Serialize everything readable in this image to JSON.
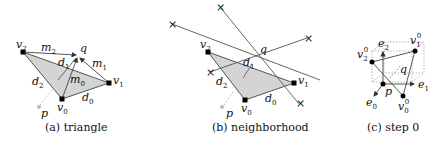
{
  "figure": {
    "panels": [
      {
        "id": "a",
        "caption": "(a) triangle",
        "labels": {
          "v2": "v",
          "v2_sub": "2",
          "m2": "m",
          "m2_sub": "2",
          "q": "q",
          "d1": "d",
          "d1_sub": "1",
          "m1": "m",
          "m1_sub": "1",
          "v1": "v",
          "v1_sub": "1",
          "d2": "d",
          "d2_sub": "2",
          "m0": "m",
          "m0_sub": "0",
          "p": "p",
          "v0": "v",
          "v0_sub": "0",
          "d0": "d",
          "d0_sub": "0"
        }
      },
      {
        "id": "b",
        "caption": "(b) neighborhood",
        "labels": {
          "v2": "v",
          "v2_sub": "2",
          "q": "q",
          "d1": "d",
          "d1_sub": "1",
          "v1": "v",
          "v1_sub": "1",
          "d2": "d",
          "d2_sub": "2",
          "p": "p",
          "v0": "v",
          "v0_sub": "0",
          "d0": "d",
          "d0_sub": "0"
        },
        "marker_glyph": "×"
      },
      {
        "id": "c",
        "caption": "(c) step 0",
        "labels": {
          "e2": "e",
          "e2_sub": "2",
          "v1": "v",
          "v1_sub": "1",
          "v1_sup": "0",
          "v2": "v",
          "v2_sub": "2",
          "v2_sup": "0",
          "q": "q",
          "e1": "e",
          "e1_sub": "1",
          "p": "p",
          "e0": "e",
          "e0_sub": "0",
          "v0": "v",
          "v0_sub": "0",
          "v0_sup": "0"
        }
      }
    ],
    "colors": {
      "fill": "#d4d4d4",
      "stroke": "#555555",
      "vertex": "#000000",
      "point_p": "#bbbbbb"
    }
  }
}
